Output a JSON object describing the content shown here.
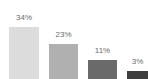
{
  "chart_data": {
    "type": "bar",
    "title": "",
    "xlabel": "",
    "ylabel": "",
    "categories": [
      "Bar 1",
      "Bar 2",
      "Bar 3",
      "Bar 4"
    ],
    "values": [
      34,
      23,
      11,
      3
    ],
    "value_labels": [
      "34%",
      "23%",
      "11%",
      "3%"
    ],
    "ylim": [
      0,
      40
    ],
    "grid": false,
    "axes_visible": false,
    "legend": false,
    "legend_position": "none",
    "background_color": "#ffffff",
    "label_color": "#6b6b6b",
    "bar_colors": [
      "#dcdcdc",
      "#b0b0b0",
      "#6a6a6a",
      "#3f3f3f"
    ],
    "bars": [
      {
        "label": "34%",
        "value": 34,
        "color": "#dcdcdc",
        "left_px": 9,
        "width_px": 30,
        "height_px": 52,
        "label_top_px": 13
      },
      {
        "label": "23%",
        "value": 23,
        "color": "#b0b0b0",
        "left_px": 49,
        "width_px": 29,
        "height_px": 35,
        "label_top_px": 30
      },
      {
        "label": "11%",
        "value": 11,
        "color": "#6a6a6a",
        "left_px": 88,
        "width_px": 29,
        "height_px": 19,
        "label_top_px": 46
      },
      {
        "label": "3%",
        "value": 3,
        "color": "#3f3f3f",
        "left_px": 127,
        "width_px": 21,
        "height_px": 8,
        "label_top_px": 57
      }
    ]
  }
}
